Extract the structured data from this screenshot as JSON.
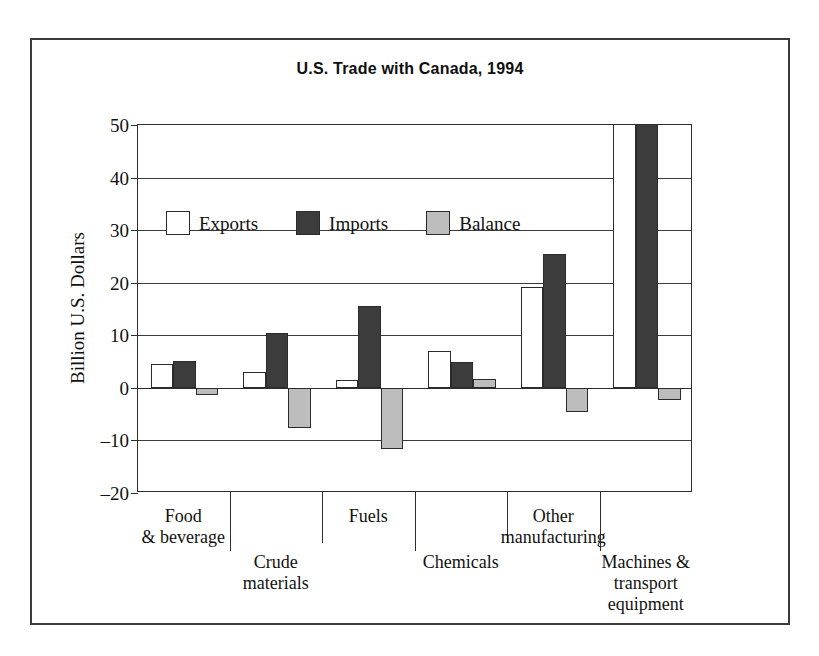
{
  "figure": {
    "title": "U.S. Trade with Canada, 1994"
  },
  "chart_data": {
    "type": "bar",
    "title": "U.S. Trade with Canada, 1994",
    "xlabel": "",
    "ylabel": "Billion U.S. Dollars",
    "ylim": [
      -20,
      50
    ],
    "yticks": [
      50,
      40,
      30,
      20,
      10,
      0,
      -10,
      -20
    ],
    "ytick_labels": [
      "50",
      "40",
      "30",
      "20",
      "10",
      "0",
      "–10",
      "–20"
    ],
    "grid": true,
    "legend_position": "upper-left-inside",
    "categories": [
      "Food\n& beverage",
      "Crude\nmaterials",
      "Fuels",
      "Chemicals",
      "Other\nmanufacturing",
      "Machines &\ntransport\nequipment"
    ],
    "category_lines": [
      [
        "Food",
        "& beverage"
      ],
      [
        "Crude",
        "materials"
      ],
      [
        "Fuels"
      ],
      [
        "Chemicals"
      ],
      [
        "Other",
        "manufacturing"
      ],
      [
        "Machines &",
        "transport",
        "equipment"
      ]
    ],
    "series": [
      {
        "name": "Exports",
        "color": "#ffffff",
        "values": [
          4.5,
          3.0,
          1.5,
          7.0,
          19.2,
          52.0
        ],
        "clipped": [
          false,
          false,
          false,
          false,
          false,
          true
        ]
      },
      {
        "name": "Imports",
        "color": "#3c3c3c",
        "values": [
          5.2,
          10.4,
          15.5,
          5.0,
          25.4,
          54.0
        ],
        "clipped": [
          false,
          false,
          false,
          false,
          false,
          true
        ]
      },
      {
        "name": "Balance",
        "color": "#bdbdbd",
        "values": [
          -1.4,
          -7.6,
          -11.6,
          1.6,
          -4.5,
          -2.4
        ],
        "clipped": [
          false,
          false,
          false,
          false,
          false,
          false
        ]
      }
    ]
  },
  "legend": {
    "items": [
      {
        "label": "Exports",
        "swatch": "exports"
      },
      {
        "label": "Imports",
        "swatch": "imports"
      },
      {
        "label": "Balance",
        "swatch": "balance"
      }
    ]
  }
}
